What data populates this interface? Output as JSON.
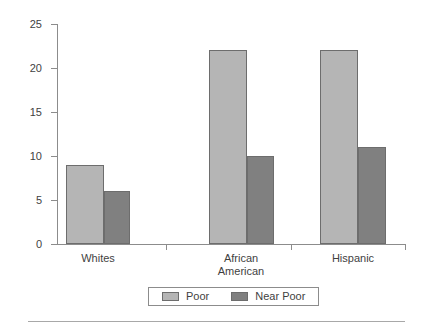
{
  "chart_data": {
    "type": "bar",
    "title": "",
    "subtitle": "",
    "xlabel": "",
    "ylabel": "",
    "categories": [
      "Whites",
      "African\nAmerican",
      "Hispanic"
    ],
    "series": [
      {
        "name": "Poor",
        "values": [
          9,
          22,
          22
        ],
        "color": "#b5b5b5"
      },
      {
        "name": "Near Poor",
        "values": [
          6,
          10,
          11
        ],
        "color": "#808080"
      }
    ],
    "ylim": [
      0,
      25
    ],
    "yticks": [
      0,
      5,
      10,
      15,
      20,
      25
    ],
    "ytick_labels": [
      "0",
      "5",
      "10",
      "15",
      "20",
      "25"
    ],
    "grid": false,
    "legend_position": "bottom",
    "legend_entries": [
      "Poor",
      "Near Poor"
    ],
    "annotations": []
  },
  "axes": {
    "y_tick_labels": [
      "25",
      "20",
      "15",
      "10",
      "5",
      "0"
    ],
    "x_category_labels": [
      "Whites",
      "African\nAmerican",
      "Hispanic"
    ]
  },
  "legend": {
    "items": [
      {
        "label": "Poor",
        "swatch": "poor-swatch"
      },
      {
        "label": "Near Poor",
        "swatch": "near-poor-swatch"
      }
    ]
  }
}
